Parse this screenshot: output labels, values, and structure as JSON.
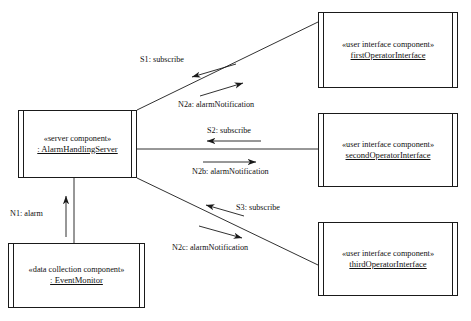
{
  "diagram": {
    "kind": "uml-communication-diagram",
    "stroke_color": "#1a1a1a",
    "background_color": "#ffffff"
  },
  "components": {
    "server": {
      "stereotype": "«server component»",
      "instance": ": AlarmHandlingServer"
    },
    "event_monitor": {
      "stereotype": "«data collection component»",
      "instance": ": EventMonitor"
    },
    "first_operator": {
      "stereotype": "«user interface component»",
      "instance": "firstOperatorInterface"
    },
    "second_operator": {
      "stereotype": "«user interface component»",
      "instance": "secondOperatorInterface"
    },
    "third_operator": {
      "stereotype": "«user interface component»",
      "instance": "thirdOperatorInterface"
    }
  },
  "messages": {
    "s1": "S1: subscribe",
    "n2a": "N2a: alarmNotification",
    "s2": "S2: subscribe",
    "n2b": "N2b: alarmNotification",
    "s3": "S3: subscribe",
    "n2c": "N2c: alarmNotification",
    "n1": "N1: alarm"
  }
}
